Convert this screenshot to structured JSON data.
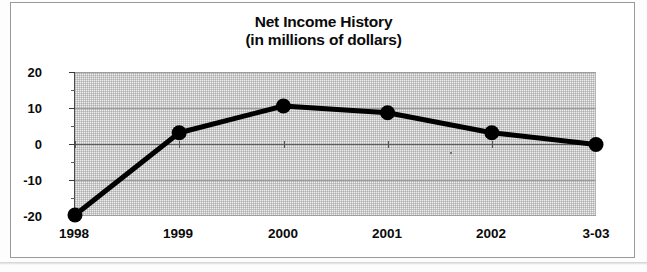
{
  "chart_data": {
    "type": "line",
    "title": "Net Income History",
    "subtitle": "(in millions of dollars)",
    "xlabel": "",
    "ylabel": "",
    "categories": [
      "1998",
      "1999",
      "2000",
      "2001",
      "2002",
      "3-03"
    ],
    "values": [
      -20,
      3,
      10.5,
      8.6,
      3,
      -0.3
    ],
    "series": [
      {
        "name": "Net Income",
        "values": [
          -20,
          3,
          10.5,
          8.6,
          3,
          -0.3
        ]
      }
    ],
    "ylim": [
      -20,
      20
    ],
    "ytick_labels": [
      "20",
      "10",
      "0",
      "-10",
      "-20"
    ],
    "ytick_values": [
      20,
      10,
      0,
      -10,
      -20
    ],
    "yminor_tick_values": [
      15,
      5,
      -5,
      -15
    ],
    "grid": true,
    "legend": "none",
    "marker": "filled-circle",
    "line_color": "#000000",
    "plot_background": "#ededed"
  },
  "frame": {
    "border_color": "#9a9a9a"
  }
}
